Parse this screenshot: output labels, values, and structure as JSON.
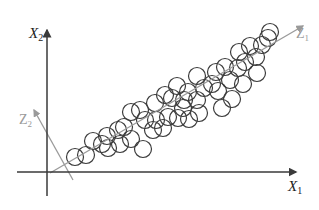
{
  "diagram": {
    "type": "pca-scatter",
    "colors": {
      "axis": "#3a3a3a",
      "pc_axis": "#9a9a9a",
      "pc_label": "#9a9a9a",
      "point_stroke": "#3c3c3c",
      "point_fill": "#ffffff",
      "label": "#222222"
    },
    "axes": {
      "x": {
        "label": "X",
        "sub": "1"
      },
      "y": {
        "label": "X",
        "sub": "2"
      }
    },
    "components": {
      "z1": {
        "label": "Z",
        "sub": "1"
      },
      "z2": {
        "label": "Z",
        "sub": "2"
      }
    },
    "point_radius": 8.5,
    "points": [
      [
        75,
        157
      ],
      [
        86,
        155
      ],
      [
        93,
        141
      ],
      [
        102,
        144
      ],
      [
        107,
        136
      ],
      [
        108,
        148
      ],
      [
        118,
        130
      ],
      [
        120,
        144
      ],
      [
        124,
        127
      ],
      [
        131,
        112
      ],
      [
        131,
        139
      ],
      [
        140,
        110
      ],
      [
        145,
        120
      ],
      [
        143,
        149
      ],
      [
        153,
        130
      ],
      [
        156,
        120
      ],
      [
        155,
        103
      ],
      [
        163,
        128
      ],
      [
        165,
        95
      ],
      [
        168,
        117
      ],
      [
        172,
        98
      ],
      [
        178,
        118
      ],
      [
        177,
        86
      ],
      [
        183,
        108
      ],
      [
        184,
        100
      ],
      [
        188,
        92
      ],
      [
        189,
        119
      ],
      [
        197,
        100
      ],
      [
        197,
        76
      ],
      [
        199,
        113
      ],
      [
        204,
        88
      ],
      [
        212,
        84
      ],
      [
        216,
        72
      ],
      [
        218,
        91
      ],
      [
        222,
        108
      ],
      [
        225,
        67
      ],
      [
        230,
        80
      ],
      [
        232,
        99
      ],
      [
        238,
        68
      ],
      [
        239,
        52
      ],
      [
        243,
        84
      ],
      [
        245,
        62
      ],
      [
        250,
        46
      ],
      [
        256,
        57
      ],
      [
        262,
        45
      ],
      [
        257,
        73
      ],
      [
        268,
        38
      ],
      [
        270,
        32
      ]
    ]
  }
}
